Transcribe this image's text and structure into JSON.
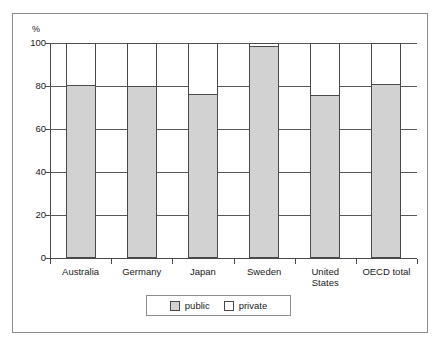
{
  "chart_data": {
    "type": "bar",
    "title": "",
    "subtitle": "",
    "xlabel": "",
    "ylabel": "",
    "unit_label": "%",
    "ylim": [
      0,
      100
    ],
    "ytick_values": [
      100,
      80,
      60,
      40,
      20,
      0
    ],
    "ytick_labels": [
      "100",
      "80",
      "60",
      "40",
      "20",
      "0"
    ],
    "grid": true,
    "stacked": true,
    "stack_total": 100,
    "legend_position": "bottom-center",
    "categories": [
      "Australia",
      "Germany",
      "Japan",
      "Sweden",
      "United States",
      "OECD total"
    ],
    "category_label_lines": [
      [
        "Australia"
      ],
      [
        "Germany"
      ],
      [
        "Japan"
      ],
      [
        "Sweden"
      ],
      [
        "United",
        "States"
      ],
      [
        "OECD total"
      ]
    ],
    "series": [
      {
        "name": "public",
        "color": "#d2d2d2",
        "values": [
          80,
          79.5,
          76,
          98,
          75.5,
          80.5
        ]
      },
      {
        "name": "private",
        "color": "#ffffff",
        "values": [
          20,
          20.5,
          24,
          2,
          24.5,
          19.5
        ]
      }
    ],
    "legend": [
      {
        "label": "public",
        "swatch": "public"
      },
      {
        "label": "private",
        "swatch": "private"
      }
    ]
  }
}
